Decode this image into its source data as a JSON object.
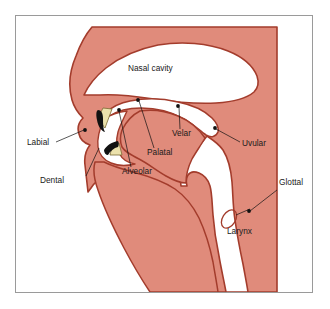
{
  "figure": {
    "type": "anatomical-diagram",
    "background_color": "#ffffff",
    "frame_border_color": "#9a9a9a"
  },
  "colors": {
    "tissue_fill": "#e08b7b",
    "tissue_outline": "#a33c2c",
    "airway_fill": "#ffffff",
    "tooth_fill": "#ece2ac",
    "tooth_outline": "#7a6a33",
    "lip_wedge": "#121212",
    "label_text": "#1a1a1a",
    "leader_line": "#111111"
  },
  "cavity_labels": [
    {
      "name": "nasal-cavity",
      "text": "Nasal cavity",
      "x": 128,
      "y": 71
    }
  ],
  "articulation_labels": [
    {
      "name": "labial",
      "text": "Labial",
      "text_x": 27,
      "text_y": 145,
      "anchor_x": 85,
      "anchor_y": 130,
      "leader": "M 56 142 L 84 130"
    },
    {
      "name": "dental",
      "text": "Dental",
      "text_x": 69,
      "text_y": 183,
      "anchor_x": 99,
      "anchor_y": 147,
      "leader": "M 86 176 L 99 148"
    },
    {
      "name": "alveolar",
      "text": "Alveolar",
      "text_x": 122,
      "text_y": 174,
      "anchor_x": 119,
      "anchor_y": 110,
      "leader": "M 131 167 L 119 111"
    },
    {
      "name": "palatal",
      "text": "Palatal",
      "text_x": 147,
      "text_y": 155,
      "anchor_x": 138,
      "anchor_y": 100,
      "leader": "M 154 148 L 139 101"
    },
    {
      "name": "velar",
      "text": "Velar",
      "text_x": 172,
      "text_y": 136,
      "anchor_x": 178,
      "anchor_y": 106,
      "leader": "M 180 129 L 179 107"
    },
    {
      "name": "uvular",
      "text": "Uvular",
      "text_x": 242,
      "text_y": 146,
      "anchor_x": 215,
      "anchor_y": 128,
      "leader": "M 240 142 L 216 129"
    },
    {
      "name": "glottal",
      "text": "Glottal",
      "text_x": 273,
      "text_y": 185,
      "anchor_x": 249,
      "anchor_y": 212,
      "leader": "M 277 190 L 250 211"
    }
  ],
  "structure_labels": [
    {
      "name": "larynx",
      "text": "Larynx",
      "text_x": 227,
      "text_y": 234,
      "marker": "ellipse"
    }
  ]
}
